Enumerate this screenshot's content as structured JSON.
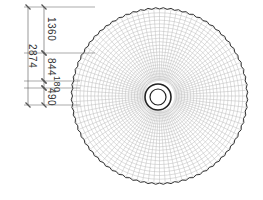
{
  "drawing": {
    "type": "radial mesh plan view",
    "colors": {
      "background": "#ffffff",
      "outline": "#333333",
      "mesh": "#bbbbbb",
      "dimension": "#555555"
    },
    "outer_circle": {
      "cx": 159.5,
      "cy": 96,
      "r": 87,
      "serrations": 72
    },
    "inner_ring_outer": {
      "r": 13
    },
    "inner_ring_inner": {
      "r": 8
    },
    "mesh": {
      "radial_lines": 96,
      "rings": 22
    }
  },
  "dimensions": {
    "overall": {
      "label": "2874",
      "x": 28,
      "y1": 7,
      "y2": 105
    },
    "segments": [
      {
        "label": "1360",
        "x": 44,
        "y1": 7,
        "y2": 53
      },
      {
        "label": "844",
        "x": 44,
        "y1": 53,
        "y2": 81
      },
      {
        "label": "180",
        "x": 44,
        "y1": 81,
        "y2": 88
      },
      {
        "label": "490",
        "x": 44,
        "y1": 88,
        "y2": 105
      }
    ],
    "extension_lines_y": [
      7,
      53,
      81,
      88,
      105
    ]
  }
}
